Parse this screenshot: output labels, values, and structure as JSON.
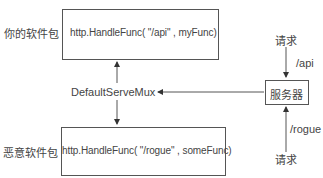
{
  "diagram": {
    "your_package": {
      "label": "你的软件包",
      "code": "http.HandleFunc( \"/api\" , myFunc)"
    },
    "rogue_package": {
      "label": "恶意软件包",
      "code": "http.HandleFunc( \"/rogue\" , someFunc)"
    },
    "mux": {
      "label": "DefaultServeMux"
    },
    "server": {
      "label": "服务器"
    },
    "request_top": {
      "label": "请求",
      "path": "/api"
    },
    "request_bottom": {
      "label": "请求",
      "path": "/rogue"
    },
    "colors": {
      "line": "#555555",
      "text": "#444444",
      "background": "#ffffff"
    }
  }
}
